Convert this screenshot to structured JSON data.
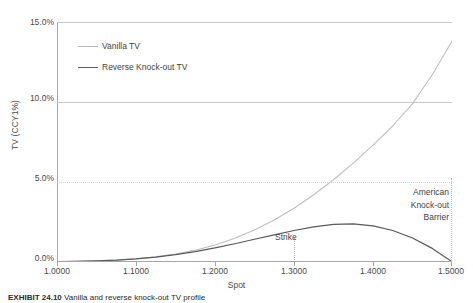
{
  "chart_data": {
    "type": "line",
    "title": "",
    "xlabel": "Spot",
    "ylabel": "TV (CCY1%)",
    "xlim": [
      1.0,
      1.5
    ],
    "ylim": [
      0.0,
      15.0
    ],
    "grid": true,
    "legend_position": "upper-left-inside",
    "x_ticks": [
      "1.0000",
      "1.1000",
      "1.2000",
      "1.3000",
      "1.4000",
      "1.5000"
    ],
    "x_tick_values": [
      1.0,
      1.1,
      1.2,
      1.3,
      1.4,
      1.5
    ],
    "y_ticks": [
      "0.0%",
      "5.0%",
      "10.0%",
      "15.0%"
    ],
    "y_tick_values": [
      0.0,
      5.0,
      10.0,
      15.0
    ],
    "x": [
      1.0,
      1.025,
      1.05,
      1.075,
      1.1,
      1.125,
      1.15,
      1.175,
      1.2,
      1.225,
      1.25,
      1.275,
      1.3,
      1.325,
      1.35,
      1.375,
      1.4,
      1.425,
      1.45,
      1.475,
      1.5
    ],
    "series": [
      {
        "name": "Vanilla TV",
        "color": "#bfbfbf",
        "values": [
          0.02,
          0.04,
          0.07,
          0.12,
          0.2,
          0.32,
          0.5,
          0.74,
          1.06,
          1.48,
          2.0,
          2.63,
          3.36,
          4.2,
          5.14,
          6.18,
          7.3,
          8.5,
          9.9,
          11.7,
          13.8
        ]
      },
      {
        "name": "Reverse Knock-out TV",
        "color": "#595959",
        "values": [
          0.02,
          0.04,
          0.07,
          0.12,
          0.2,
          0.31,
          0.46,
          0.65,
          0.88,
          1.14,
          1.42,
          1.7,
          1.97,
          2.2,
          2.35,
          2.38,
          2.26,
          1.97,
          1.5,
          0.85,
          0.02
        ]
      }
    ],
    "annotations": [
      {
        "text": "Strike",
        "x": 1.3,
        "type": "vertical-dotted-line"
      },
      {
        "text": "American\nKnock-out\nBarrier",
        "x": 1.5,
        "type": "vertical-dotted-line"
      }
    ]
  },
  "axes": {
    "y_title": "TV (CCY1%)",
    "x_title": "Spot",
    "y_tick_labels": [
      "15.0%",
      "10.0%",
      "5.0%",
      "0.0%"
    ],
    "x_tick_labels": [
      "1.0000",
      "1.1000",
      "1.2000",
      "1.3000",
      "1.4000",
      "1.5000"
    ]
  },
  "legend": {
    "items": [
      {
        "label": "Vanilla TV"
      },
      {
        "label": "Reverse Knock-out TV"
      }
    ]
  },
  "annotations": {
    "strike": "Strike",
    "barrier_line1": "American",
    "barrier_line2": "Knock-out",
    "barrier_line3": "Barrier"
  },
  "caption": {
    "label": "EXHIBIT 24.10",
    "text": "Vanilla and reverse knock-out TV profile"
  }
}
